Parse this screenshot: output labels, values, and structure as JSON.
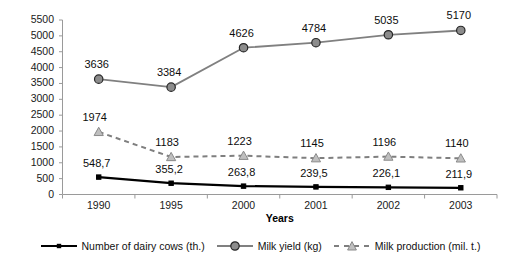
{
  "chart_data": {
    "type": "line",
    "title": "",
    "xlabel": "Years",
    "ylabel": "",
    "categories": [
      "1990",
      "1995",
      "2000",
      "2001",
      "2002",
      "2003"
    ],
    "ylim": [
      0,
      5500
    ],
    "ytick_step": 500,
    "yticks": [
      "5500",
      "5000",
      "4500",
      "4000",
      "3500",
      "3000",
      "2500",
      "2000",
      "1500",
      "1000",
      "500",
      "0"
    ],
    "grid": false,
    "legend_position": "bottom",
    "series": [
      {
        "name": "Number of dairy cows (th.)",
        "values": [
          548.7,
          355.2,
          263.8,
          239.5,
          226.1,
          211.9
        ],
        "labels": [
          "548,7",
          "355,2",
          "263,8",
          "239,5",
          "226,1",
          "211,9"
        ],
        "color": "#000000",
        "line_style": "solid",
        "marker": "small-square"
      },
      {
        "name": "Milk yield (kg)",
        "values": [
          3636,
          3384,
          4626,
          4784,
          5035,
          5170
        ],
        "labels": [
          "3636",
          "3384",
          "4626",
          "4784",
          "5035",
          "5170"
        ],
        "color": "#808080",
        "line_style": "solid",
        "marker": "circle"
      },
      {
        "name": "Milk production (mil. t.)",
        "values": [
          1974,
          1183,
          1223,
          1145,
          1196,
          1140
        ],
        "labels": [
          "1974",
          "1183",
          "1223",
          "1145",
          "1196",
          "1140"
        ],
        "color": "#7f7f7f",
        "line_style": "dashed",
        "marker": "triangle"
      }
    ]
  },
  "colors": {
    "axis": "#9a9a9a",
    "text": "#111111",
    "series_black": "#000000",
    "series_gray": "#808080",
    "marker_fill_gray": "#8c8c8c",
    "marker_fill_light": "#bfbfbf",
    "background": "#ffffff"
  }
}
